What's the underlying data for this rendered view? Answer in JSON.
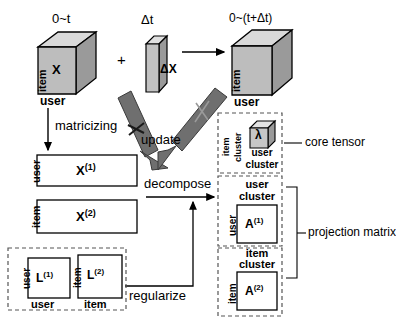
{
  "diagram": {
    "type": "flow-diagram"
  },
  "tensors": {
    "base": {
      "top_label": "0~t",
      "face_label": "X",
      "axis_vertical": "item",
      "axis_horizontal": "user"
    },
    "delta": {
      "top_label": "Δt",
      "face_label": "ΔX"
    },
    "result": {
      "top_label": "0~(t+Δt)",
      "axis_vertical": "item",
      "axis_horizontal": "user"
    },
    "core": {
      "face_label": "λ",
      "axis_vertical_outer": "item",
      "axis_vertical_inner": "cluster",
      "axis_horizontal_line1": "user",
      "axis_horizontal_line2": "cluster"
    }
  },
  "operators": {
    "plus": "+"
  },
  "matrices": {
    "x1": {
      "label": "X",
      "sup": "(1)",
      "axis_vertical": "user"
    },
    "x2": {
      "label": "X",
      "sup": "(2)",
      "axis_vertical": "item"
    },
    "l1": {
      "label": "L",
      "sup": "(1)",
      "axis_vertical": "user",
      "axis_horizontal": "user"
    },
    "l2": {
      "label": "L",
      "sup": "(2)",
      "axis_vertical": "item",
      "axis_horizontal": "item"
    },
    "a1": {
      "label": "A",
      "sup": "(1)",
      "axis_vertical": "user",
      "axis_top_line1": "user",
      "axis_top_line2": "cluster"
    },
    "a2": {
      "label": "A",
      "sup": "(2)",
      "axis_vertical": "item",
      "axis_top_line1": "item",
      "axis_top_line2": "cluster"
    }
  },
  "arrow_labels": {
    "matricizing": "matricizing",
    "update": "update",
    "decompose": "decompose",
    "regularize": "regularize"
  },
  "annotations": {
    "core_tensor": "core tensor",
    "projection_matrix": "projection matrix"
  },
  "colors": {
    "cube_front": "#b4b4b4",
    "cube_top": "#d9d9d9",
    "cube_side": "#8e8e8e",
    "arrow_gray": "#7a7a7a",
    "stroke": "#000000",
    "dashed": "#555555"
  }
}
